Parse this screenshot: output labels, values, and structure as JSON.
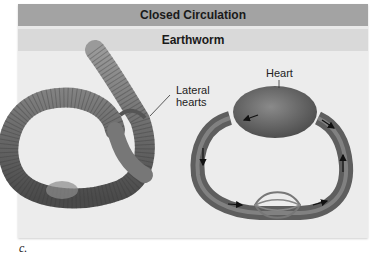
{
  "figure": {
    "title": "Closed Circulation",
    "subtitle": "Earthworm",
    "labels": {
      "lateral_hearts": "Lateral\nhearts",
      "heart": "Heart"
    },
    "caption": "c."
  },
  "colors": {
    "title_bar": "#a3a3a3",
    "subtitle_bar": "#d9d9d9",
    "background": "#ececec"
  }
}
